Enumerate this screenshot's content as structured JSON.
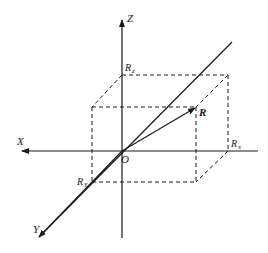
{
  "figure": {
    "axes": {
      "x_label": "X",
      "y_label": "Y",
      "z_label": "Z",
      "origin_label": "O"
    },
    "vector": {
      "label": "R"
    },
    "components": {
      "rx_label": "R",
      "rx_sub": "x",
      "ry_label": "R",
      "ry_sub": "Y",
      "rz_label": "R",
      "rz_sub": "z"
    },
    "colors": {
      "ink": "#1a1a1a",
      "background": "#ffffff"
    }
  }
}
